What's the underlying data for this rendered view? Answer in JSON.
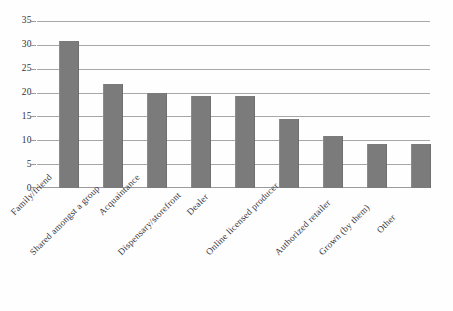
{
  "chart_data": {
    "type": "bar",
    "title": "",
    "subtitle": "",
    "xlabel": "",
    "ylabel": "",
    "ylim": [
      0,
      35
    ],
    "ytick_step": 5,
    "yticks": [
      "0",
      "5",
      "10",
      "15",
      "20",
      "25",
      "30",
      "35"
    ],
    "grid": true,
    "legend": false,
    "legend_position": "none",
    "bar_color": "#7b7b7b",
    "gridline_color": "#9a9a9a",
    "axis_text_color": "#33323a",
    "categories": [
      "Family/friend",
      "Shared amongst a group",
      "Acquaintance",
      "Dispensary/storefront",
      "Dealer",
      "Online licensed producer",
      "Authorized retailer",
      "Grown (by them)",
      "Other"
    ],
    "values": [
      31,
      22,
      20,
      19.5,
      19.5,
      14.5,
      11,
      9.3,
      9.3
    ]
  }
}
